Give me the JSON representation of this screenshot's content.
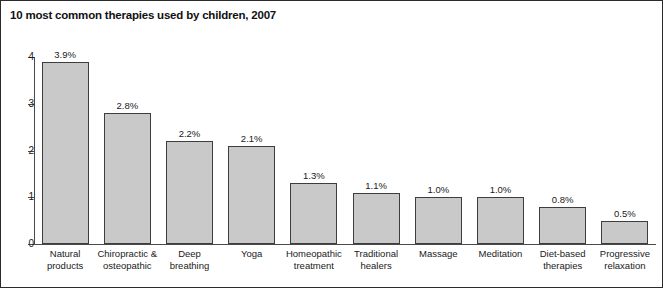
{
  "figure": {
    "title": "10 most common therapies used by children, 2007",
    "border_color": "#2b2b2b",
    "background": "#ffffff"
  },
  "chart_data": {
    "type": "bar",
    "title": "10 most common therapies used by children, 2007",
    "xlabel": "",
    "ylabel": "",
    "ylim": [
      0,
      4
    ],
    "yticks": [
      0,
      1,
      2,
      3,
      4
    ],
    "ytick_labels": [
      "0",
      "1",
      "2",
      "3",
      "4"
    ],
    "grid": false,
    "legend": null,
    "orientation": "vertical",
    "bar_color": "#c9c9c9",
    "bar_edge_color": "#3d3d3d",
    "value_unit": "%",
    "categories": [
      "Natural products",
      "Chiropractic & osteopathic",
      "Deep breathing",
      "Yoga",
      "Homeopathic treatment",
      "Traditional healers",
      "Massage",
      "Meditation",
      "Diet-based therapies",
      "Progressive relaxation"
    ],
    "category_lines": [
      [
        "Natural",
        "products"
      ],
      [
        "Chiropractic &",
        "osteopathic"
      ],
      [
        "Deep",
        "breathing"
      ],
      [
        "Yoga",
        ""
      ],
      [
        "Homeopathic",
        "treatment"
      ],
      [
        "Traditional",
        "healers"
      ],
      [
        "Massage",
        ""
      ],
      [
        "Meditation",
        ""
      ],
      [
        "Diet-based",
        "therapies"
      ],
      [
        "Progressive",
        "relaxation"
      ]
    ],
    "values": [
      3.9,
      2.8,
      2.2,
      2.1,
      1.3,
      1.1,
      1.0,
      1.0,
      0.8,
      0.5
    ],
    "data_labels": [
      "3.9%",
      "2.8%",
      "2.2%",
      "2.1%",
      "1.3%",
      "1.1%",
      "1.0%",
      "1.0%",
      "0.8%",
      "0.5%"
    ]
  }
}
